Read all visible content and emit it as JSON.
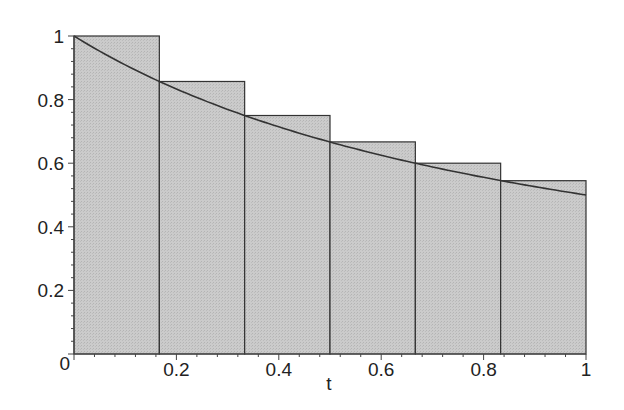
{
  "chart_data": {
    "type": "bar",
    "title": "",
    "xlabel": "t",
    "ylabel": "",
    "xlim": [
      0,
      1
    ],
    "ylim": [
      0,
      1
    ],
    "grid": false,
    "x_ticks": [
      "0.2",
      "0.4",
      "0.6",
      "0.8",
      "1"
    ],
    "y_ticks": [
      "0",
      "0.2",
      "0.4",
      "0.6",
      "0.8",
      "1"
    ],
    "bars": {
      "edges": [
        0,
        0.1667,
        0.3333,
        0.5,
        0.6667,
        0.8333,
        1
      ],
      "heights": [
        1.0,
        0.857,
        0.75,
        0.667,
        0.6,
        0.545
      ],
      "fill": "#c8c8c8",
      "stroke": "#333333"
    },
    "curve": {
      "name": "1/(1+t)",
      "x": [
        0,
        0.1,
        0.2,
        0.3,
        0.4,
        0.5,
        0.6,
        0.7,
        0.8,
        0.9,
        1.0
      ],
      "y": [
        1.0,
        0.909,
        0.833,
        0.769,
        0.714,
        0.667,
        0.625,
        0.588,
        0.556,
        0.526,
        0.5
      ],
      "color": "#333333"
    }
  }
}
